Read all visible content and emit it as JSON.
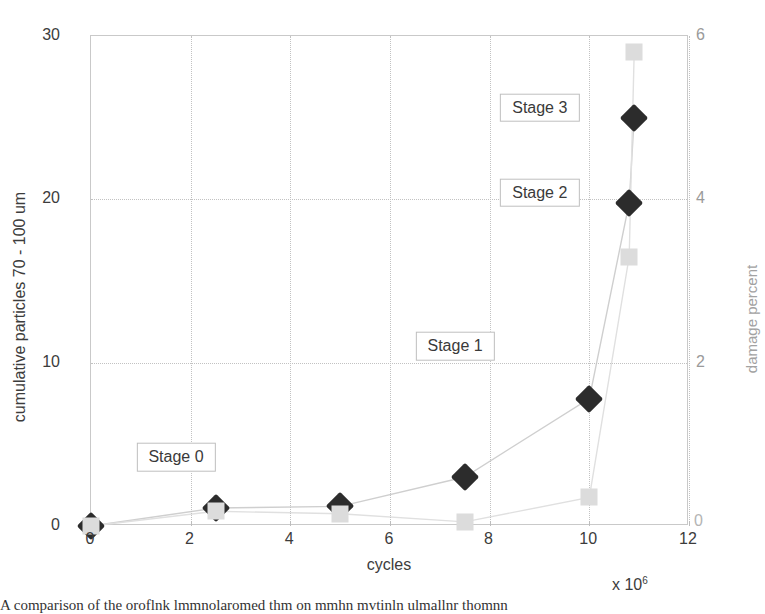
{
  "chart_data": {
    "type": "line",
    "title": "",
    "xlabel": "cycles",
    "x_multiplier": "x 10",
    "x_multiplier_exp": "6",
    "ylabel": "cumulative particles 70 - 100 um",
    "ylabel_right": "damage percent",
    "xlim": [
      0,
      12
    ],
    "ylim": [
      0,
      30
    ],
    "ylim_right": [
      0,
      6
    ],
    "grid": true,
    "grid_style": "dotted",
    "legend": "none",
    "xticks": [
      "0",
      "2",
      "4",
      "6",
      "8",
      "10",
      "12"
    ],
    "xtick_values": [
      0,
      2,
      4,
      6,
      8,
      10,
      12
    ],
    "yticks_left": [
      "0",
      "10",
      "20",
      "30"
    ],
    "ytick_values_left": [
      0,
      10,
      20,
      30
    ],
    "yticks_right": [
      "0",
      "2",
      "4",
      "6"
    ],
    "ytick_values_right": [
      0,
      2,
      4,
      6
    ],
    "series": [
      {
        "name": "cumulative particles 70 - 100 um",
        "axis": "left",
        "marker": "diamond",
        "color": "#2c2c2c",
        "x": [
          0,
          2.5,
          5.0,
          7.5,
          10.0,
          10.8,
          10.9
        ],
        "values": [
          0,
          1.1,
          1.2,
          3.0,
          7.8,
          19.8,
          25.0
        ]
      },
      {
        "name": "damage percent",
        "axis": "right",
        "marker": "square",
        "color": "#dcdcdc",
        "x": [
          0,
          2.5,
          5.0,
          7.5,
          10.0,
          10.8,
          10.9
        ],
        "values": [
          0,
          0.18,
          0.15,
          0.05,
          0.35,
          3.3,
          5.8
        ]
      }
    ],
    "annotations": [
      {
        "label": "Stage 0",
        "x": 2.5,
        "y": 4.2
      },
      {
        "label": "Stage 1",
        "x": 8.1,
        "y": 11.0
      },
      {
        "label": "Stage 2",
        "x": 9.8,
        "y": 20.4
      },
      {
        "label": "Stage 3",
        "x": 9.8,
        "y": 25.6
      }
    ]
  },
  "caption": {
    "text": "A comparison of the oroflnk lmmnolaromed thm on mmhn mvtinln ulmallnr thomnn"
  }
}
